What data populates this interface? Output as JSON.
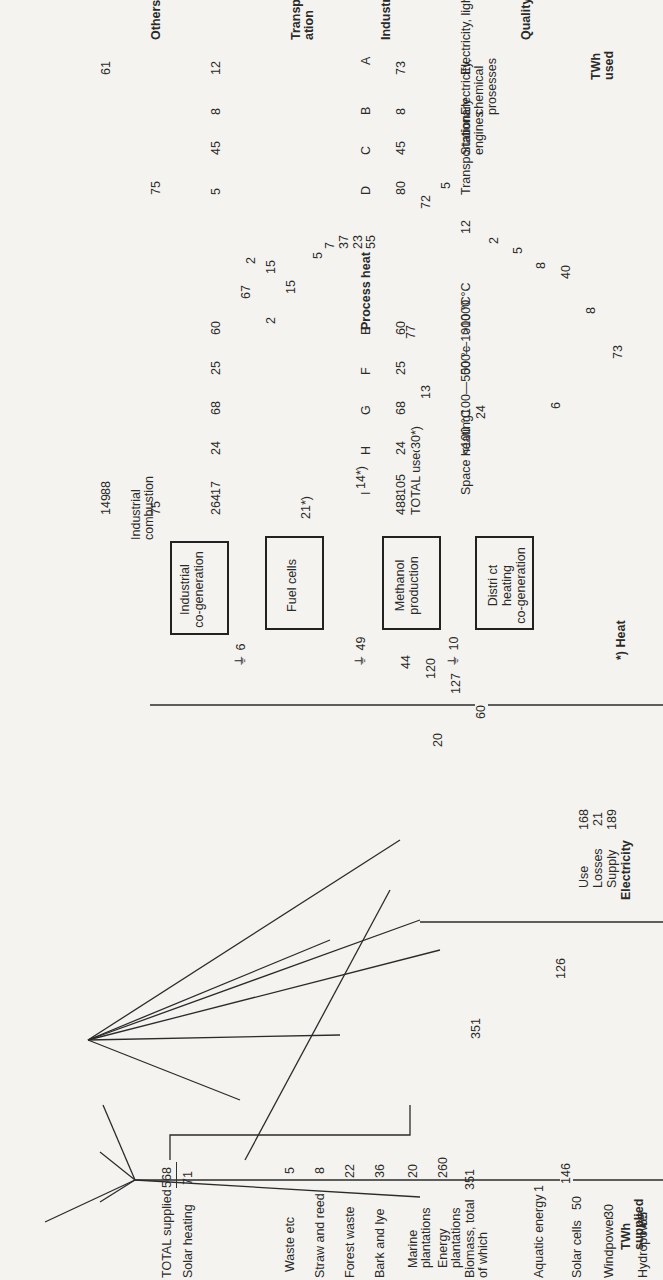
{
  "diagram": {
    "orientation": "rotated-90-ccw",
    "sources": {
      "header": "TWh supplied",
      "items": [
        {
          "name": "Hydropower",
          "value": "65"
        },
        {
          "name": "Windpower",
          "value": "30"
        },
        {
          "name": "Solar cells",
          "value": "50"
        },
        {
          "name": "Aquatic energy",
          "value": "1"
        },
        {
          "name": "Biomass, total of which",
          "value": "351"
        },
        {
          "name": "Energy plantations",
          "value": "260"
        },
        {
          "name": "Marine plantations",
          "value": "20"
        },
        {
          "name": "Bark and lye",
          "value": "36"
        },
        {
          "name": "Forest waste",
          "value": "22"
        },
        {
          "name": "Straw and reed",
          "value": "8"
        },
        {
          "name": "Waste etc",
          "value": "5"
        },
        {
          "name": "Solar heating",
          "value": "71"
        },
        {
          "name": "TOTAL supplied",
          "value": "568"
        }
      ],
      "electric_sum": "146"
    },
    "electricity": {
      "title": "Electricity",
      "supply_label": "Supply",
      "supply": "189",
      "losses_label": "Losses",
      "losses": "21",
      "use_label": "Use",
      "use": "168",
      "direct_in": "126"
    },
    "conversions": [
      {
        "name": "Industrial co-generation",
        "label1": "Industrial",
        "label2": "co-generation",
        "loss": "6"
      },
      {
        "name": "Fuel cells",
        "label1": "Fuel cells",
        "label2": "",
        "loss": "6"
      },
      {
        "name": "Methanol production",
        "label1": "Methanol",
        "label2": "production",
        "loss": "49"
      },
      {
        "name": "District heating co-generation",
        "label1": "Distri ct heating",
        "label2": "co-generation",
        "loss": "10"
      }
    ],
    "industrial_combustion": {
      "label1": "Industrial",
      "label2": "combustion"
    },
    "flows": {
      "el_A": "73",
      "el_A2": "73",
      "el_B": "8",
      "el_C": "40",
      "el_D": "8",
      "el_E": "5",
      "el_F": "2",
      "el_I": "12",
      "cogen_to_el": "6",
      "fuel_to_el": "24",
      "dh_to_el": "13",
      "fuel_heat": "30*)",
      "meth_heat": "14*)",
      "dh_heat": "21*)",
      "c_5": "5",
      "d_72": "72",
      "meth_77": "77",
      "comb_E": "55",
      "comb_F": "23",
      "comb_G": "37",
      "comb_H": "7",
      "comb_I": "5",
      "g_15": "15",
      "h_15": "15",
      "h_2": "2",
      "x_2": "2",
      "sol_67": "67",
      "bio_20": "20",
      "bio_60": "60",
      "bio_127": "127",
      "bio_120": "120",
      "bio_44": "44"
    },
    "used": {
      "header": "TWh used",
      "rows": [
        {
          "letter": "A",
          "twh": "73",
          "quality": "Electricity, lights etc",
          "industry": "12",
          "transport": "",
          "others": "61"
        },
        {
          "letter": "B",
          "twh": "8",
          "quality": "Electricity, chemical prosesses",
          "industry": "8",
          "transport": "",
          "others": ""
        },
        {
          "letter": "C",
          "twh": "45",
          "quality": "Stationary engines",
          "industry": "45",
          "transport": "",
          "others": ""
        },
        {
          "letter": "D",
          "twh": "80",
          "quality": "Transportation",
          "industry": "5",
          "transport": "75",
          "others": ""
        },
        {
          "letter": "E",
          "twh": "60",
          "quality": ">1000 °C",
          "industry": "60",
          "transport": "",
          "others": ""
        },
        {
          "letter": "F",
          "twh": "25",
          "quality": "500—1000 °C",
          "industry": "25",
          "transport": "",
          "others": ""
        },
        {
          "letter": "G",
          "twh": "68",
          "quality": "100—500 °c",
          "industry": "68",
          "transport": "",
          "others": ""
        },
        {
          "letter": "H",
          "twh": "24",
          "quality": "<100 °C",
          "industry": "24",
          "transport": "",
          "others": ""
        },
        {
          "letter": "I",
          "twh": "105",
          "quality": "Space heating",
          "industry": "17",
          "transport": "",
          "others": "88"
        }
      ],
      "process_heat_header": "Process heat",
      "quality_header": "Quality",
      "industry_header": "Industry",
      "transport_header": "Transport-ation",
      "others_header": "Others",
      "total_used_label": "TOTAL used",
      "total_used": "488",
      "industry_total": "264",
      "transport_total": "75",
      "others_total": "149"
    },
    "footnote": "*) Heat"
  }
}
